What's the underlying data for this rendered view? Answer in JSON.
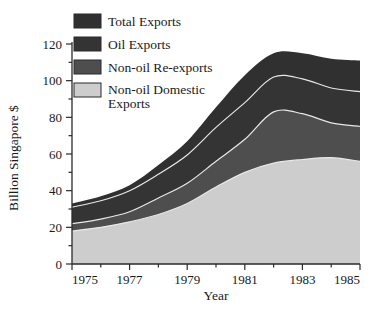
{
  "chart_data": {
    "type": "area",
    "stacked": true,
    "title": "",
    "xlabel": "Year",
    "ylabel": "Billion Singapore $",
    "xlim": [
      1975,
      1985
    ],
    "ylim": [
      0,
      120
    ],
    "ytick_labels": [
      "0",
      "20",
      "40",
      "60",
      "80",
      "100",
      "120"
    ],
    "ytick_values": [
      0,
      20,
      40,
      60,
      80,
      100,
      120
    ],
    "yminor_step": 10,
    "xtick_labels": [
      "1975",
      "1977",
      "1979",
      "1981",
      "1983",
      "1985"
    ],
    "xtick_values": [
      1975,
      1977,
      1979,
      1981,
      1983,
      1985
    ],
    "xminor_values": [
      1976,
      1978,
      1980,
      1982,
      1984
    ],
    "grid": false,
    "legend_position": "top-left-inside",
    "x": [
      1975,
      1976,
      1977,
      1978,
      1979,
      1980,
      1981,
      1982,
      1983,
      1984,
      1985
    ],
    "series": [
      {
        "name": "Non-oil Domestic Exports",
        "color": "#cdcdcd",
        "values": [
          18.0,
          20.0,
          23.0,
          27.0,
          33.0,
          42.0,
          50.0,
          55.0,
          57.0,
          58.0,
          56.0
        ]
      },
      {
        "name": "Non-oil Re-exports",
        "color": "#4e4e4e",
        "values": [
          4.0,
          4.5,
          5.5,
          9.0,
          11.0,
          14.0,
          18.0,
          28.0,
          25.0,
          19.0,
          19.0
        ]
      },
      {
        "name": "Oil Exports",
        "color": "#343434",
        "values": [
          9.0,
          10.0,
          11.5,
          13.0,
          15.5,
          18.5,
          20.0,
          19.0,
          19.0,
          19.0,
          19.0
        ]
      },
      {
        "name": "Total Exports",
        "color": "#303030",
        "values": [
          2.0,
          2.5,
          3.0,
          5.0,
          7.5,
          11.0,
          15.0,
          13.0,
          14.0,
          16.0,
          17.0
        ]
      }
    ],
    "cumulative_tops": {
      "non_oil_domestic": [
        18.0,
        20.0,
        23.0,
        27.0,
        33.0,
        42.0,
        50.0,
        55.0,
        57.0,
        58.0,
        56.0
      ],
      "non_oil_re_exports": [
        22.0,
        24.5,
        28.5,
        36.0,
        44.0,
        56.0,
        68.0,
        83.0,
        82.0,
        77.0,
        75.0
      ],
      "oil_exports": [
        31.0,
        34.5,
        40.0,
        49.0,
        59.5,
        74.5,
        88.0,
        102.0,
        101.0,
        96.0,
        94.0
      ],
      "total_exports": [
        33.0,
        37.0,
        43.0,
        54.0,
        67.0,
        85.5,
        103.0,
        115.0,
        115.0,
        112.0,
        111.0
      ]
    },
    "legend": [
      {
        "label": "Total Exports",
        "color": "#303030"
      },
      {
        "label": "Oil Exports",
        "color": "#343434"
      },
      {
        "label": "Non-oil Re-exports",
        "color": "#4e4e4e"
      },
      {
        "label": "Non-oil Domestic Exports",
        "color": "#cdcdcd"
      }
    ]
  }
}
